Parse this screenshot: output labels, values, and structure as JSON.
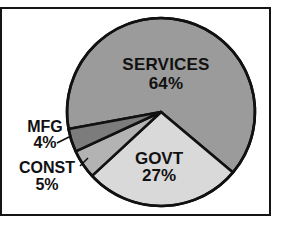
{
  "chart_data": {
    "type": "pie",
    "title": "",
    "legend": "none",
    "labels_inline": true,
    "start_angle_deg": 169.6,
    "direction": "clockwise",
    "outline_color": "#111111",
    "background_color": "#ffffff",
    "frame_border_color": "#151515",
    "slices": [
      {
        "label": "SERVICES",
        "value": 64,
        "pct_label": "64%",
        "color": "#9b9b9b"
      },
      {
        "label": "GOVT",
        "value": 27,
        "pct_label": "27%",
        "color": "#d9d9d9"
      },
      {
        "label": "CONST",
        "value": 5,
        "pct_label": "5%",
        "color": "#b3b3b3"
      },
      {
        "label": "MFG",
        "value": 4,
        "pct_label": "4%",
        "color": "#7c7c7c"
      }
    ]
  }
}
